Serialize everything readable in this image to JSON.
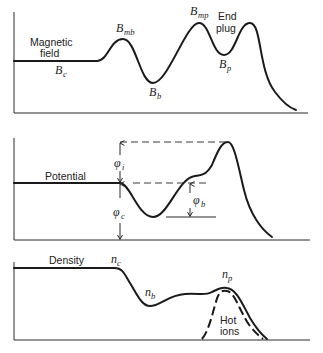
{
  "panels": {
    "magnetic": {
      "title_line1": "Magnetic",
      "title_line2": "field",
      "labels": {
        "Bc": {
          "base": "B",
          "sub": "c"
        },
        "Bmb": {
          "base": "B",
          "sub": "mb"
        },
        "Bb": {
          "base": "B",
          "sub": "b"
        },
        "Bmp": {
          "base": "B",
          "sub": "mp"
        },
        "Bp": {
          "base": "B",
          "sub": "p"
        }
      },
      "end_plug_line1": "End",
      "end_plug_line2": "plug"
    },
    "potential": {
      "title": "Potential",
      "labels": {
        "phi_i": {
          "base": "φ",
          "sub": "i"
        },
        "phi_c": {
          "base": "φ",
          "sub": "c"
        },
        "phi_b": {
          "base": "φ",
          "sub": "b"
        }
      }
    },
    "density": {
      "title": "Density",
      "labels": {
        "nc": {
          "base": "n",
          "sub": "c"
        },
        "nb": {
          "base": "n",
          "sub": "b"
        },
        "np": {
          "base": "n",
          "sub": "p"
        }
      },
      "hot_ions_line1": "Hot",
      "hot_ions_line2": "ions"
    }
  },
  "colors": {
    "line": "#1a1a1a",
    "background": "#ffffff"
  }
}
